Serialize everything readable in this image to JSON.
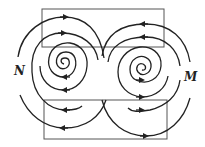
{
  "diagram": {
    "type": "field-lines",
    "labels": {
      "left": "N",
      "right": "M"
    },
    "colors": {
      "stroke": "#222222",
      "frame": "#555555",
      "background": "#ffffff"
    },
    "frames": [
      {
        "name": "upper-rectangle",
        "x": 42,
        "y": 9,
        "width": 122,
        "height": 38
      },
      {
        "name": "lower-rectangle",
        "x": 44,
        "y": 100,
        "width": 123,
        "height": 39
      }
    ],
    "vortices": [
      {
        "name": "left-vortex",
        "label": "N",
        "center": [
          66,
          66
        ],
        "top_arrow_direction": "right",
        "bottom_arrow_direction": "left"
      },
      {
        "name": "right-vortex",
        "label": "M",
        "center": [
          142,
          69
        ],
        "top_arrow_direction": "left",
        "bottom_arrow_direction": "right"
      }
    ]
  }
}
